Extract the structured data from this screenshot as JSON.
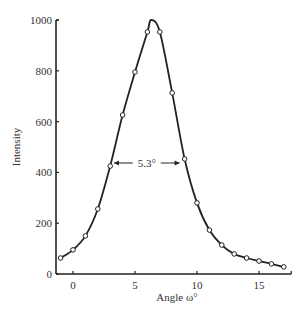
{
  "chart_data": {
    "type": "line",
    "title": "",
    "xlabel": "Angle ω°",
    "ylabel": "Intensity",
    "xlim": [
      -1.4,
      17.6
    ],
    "ylim": [
      0,
      1000
    ],
    "xticks": [
      0,
      5,
      10,
      15
    ],
    "yticks": [
      0,
      200,
      400,
      600,
      800,
      1000
    ],
    "grid": false,
    "legend": null,
    "series": [
      {
        "name": "Intensity",
        "marker": "open-circle",
        "x": [
          -1,
          0,
          1,
          2,
          3,
          4,
          5,
          6,
          7,
          8,
          9,
          10,
          11,
          12,
          13,
          14,
          15,
          16,
          17
        ],
        "y": [
          63,
          95,
          150,
          256,
          425,
          626,
          795,
          953,
          953,
          713,
          453,
          280,
          173,
          114,
          79,
          63,
          51,
          40,
          28
        ]
      }
    ],
    "curve_peak": {
      "x": 6.3,
      "y": 1000
    },
    "annotations": [
      {
        "text": "5.3°",
        "type": "fwhm-arrow",
        "x_start": 3.3,
        "x_end": 8.6,
        "y": 500
      }
    ]
  }
}
